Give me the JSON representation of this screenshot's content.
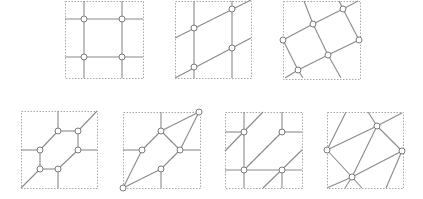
{
  "figure": {
    "width": 423,
    "height": 199,
    "colors": {
      "frame": "#a8a8a8",
      "edge": "#8a8a8a",
      "node_stroke": "#7a7a7a",
      "node_fill": "#ffffff"
    },
    "node_radius": 3,
    "panels": [
      {
        "id": "panel-1-square-grid",
        "frame": [
          65,
          1,
          78,
          77
        ],
        "edges": [
          [
            84,
            1,
            84,
            78
          ],
          [
            122,
            1,
            122,
            78
          ],
          [
            65,
            19,
            143,
            19
          ],
          [
            65,
            57,
            143,
            57
          ]
        ],
        "nodes": [
          [
            84,
            19
          ],
          [
            122,
            19
          ],
          [
            84,
            57
          ],
          [
            122,
            57
          ]
        ]
      },
      {
        "id": "panel-2-sheared-grid",
        "frame": [
          175,
          1,
          76,
          77
        ],
        "edges": [
          [
            194,
            1,
            194,
            78
          ],
          [
            232,
            1,
            232,
            78
          ],
          [
            175,
            38,
            251,
            0
          ],
          [
            175,
            78,
            251,
            38
          ]
        ],
        "nodes": [
          [
            194,
            28
          ],
          [
            232,
            9
          ],
          [
            194,
            67
          ],
          [
            232,
            48
          ]
        ]
      },
      {
        "id": "panel-3-rotated-grid",
        "frame": [
          283,
          1,
          77,
          78
        ],
        "edges": [
          [
            283,
            40,
            313,
            24
          ],
          [
            313,
            24,
            343,
            9
          ],
          [
            343,
            9,
            358,
            1
          ],
          [
            313,
            24,
            304,
            1
          ],
          [
            343,
            9,
            339,
            1
          ],
          [
            343,
            9,
            359,
            40
          ],
          [
            313,
            24,
            328,
            55
          ],
          [
            283,
            40,
            298,
            70
          ],
          [
            298,
            70,
            328,
            55
          ],
          [
            328,
            55,
            359,
            40
          ],
          [
            298,
            70,
            285,
            78
          ],
          [
            298,
            70,
            303,
            78
          ],
          [
            328,
            55,
            341,
            78
          ]
        ],
        "nodes": [
          [
            283,
            40
          ],
          [
            313,
            24
          ],
          [
            343,
            9
          ],
          [
            359,
            40
          ],
          [
            328,
            55
          ],
          [
            298,
            70
          ]
        ]
      },
      {
        "id": "panel-4-hexagon",
        "frame": [
          21,
          111,
          76,
          77
        ],
        "edges": [
          [
            58,
            131,
            78,
            131
          ],
          [
            78,
            131,
            78,
            150
          ],
          [
            78,
            150,
            58,
            169
          ],
          [
            58,
            169,
            40,
            169
          ],
          [
            40,
            169,
            40,
            150
          ],
          [
            40,
            150,
            58,
            131
          ],
          [
            58,
            131,
            58,
            111
          ],
          [
            78,
            131,
            97,
            111
          ],
          [
            78,
            150,
            97,
            150
          ],
          [
            58,
            169,
            58,
            188
          ],
          [
            40,
            169,
            21,
            188
          ],
          [
            40,
            150,
            21,
            150
          ]
        ],
        "nodes": [
          [
            58,
            131
          ],
          [
            78,
            131
          ],
          [
            78,
            150
          ],
          [
            58,
            169
          ],
          [
            40,
            169
          ],
          [
            40,
            150
          ]
        ]
      },
      {
        "id": "panel-5-diamond",
        "frame": [
          123,
          112,
          77,
          76
        ],
        "edges": [
          [
            123,
            188,
            142,
            150
          ],
          [
            142,
            150,
            161,
            131
          ],
          [
            161,
            131,
            199,
            112
          ],
          [
            123,
            188,
            161,
            169
          ],
          [
            161,
            169,
            180,
            150
          ],
          [
            180,
            150,
            199,
            112
          ],
          [
            161,
            131,
            180,
            150
          ],
          [
            161,
            131,
            161,
            112
          ],
          [
            161,
            169,
            161,
            188
          ],
          [
            123,
            150,
            142,
            150
          ],
          [
            180,
            150,
            200,
            150
          ]
        ],
        "nodes": [
          [
            199,
            112
          ],
          [
            161,
            131
          ],
          [
            142,
            150
          ],
          [
            180,
            150
          ],
          [
            161,
            169
          ],
          [
            123,
            188
          ]
        ]
      },
      {
        "id": "panel-6-grid-diagonals",
        "frame": [
          225,
          112,
          77,
          76
        ],
        "edges": [
          [
            244,
            112,
            244,
            188
          ],
          [
            282,
            112,
            282,
            132
          ],
          [
            282,
            170,
            282,
            188
          ],
          [
            225,
            132,
            244,
            132
          ],
          [
            282,
            132,
            302,
            132
          ],
          [
            225,
            170,
            302,
            170
          ],
          [
            225,
            151,
            263,
            112
          ],
          [
            244,
            170,
            282,
            132
          ],
          [
            263,
            188,
            302,
            150
          ]
        ],
        "nodes": [
          [
            244,
            132
          ],
          [
            282,
            132
          ],
          [
            244,
            170
          ],
          [
            282,
            170
          ]
        ]
      },
      {
        "id": "panel-7-irregular",
        "frame": [
          327,
          112,
          76,
          76
        ],
        "edges": [
          [
            327,
            150,
            377,
            126
          ],
          [
            377,
            126,
            402,
            113
          ],
          [
            327,
            150,
            346,
            112
          ],
          [
            368,
            112,
            377,
            126
          ],
          [
            377,
            126,
            402,
            151
          ],
          [
            327,
            150,
            352,
            177
          ],
          [
            352,
            177,
            362,
            188
          ],
          [
            352,
            177,
            402,
            151
          ],
          [
            327,
            188,
            352,
            177
          ],
          [
            352,
            177,
            377,
            126
          ],
          [
            352,
            177,
            345,
            188
          ],
          [
            402,
            151,
            386,
            188
          ]
        ],
        "nodes": [
          [
            327,
            150
          ],
          [
            377,
            126
          ],
          [
            402,
            151
          ],
          [
            352,
            177
          ]
        ]
      }
    ]
  }
}
